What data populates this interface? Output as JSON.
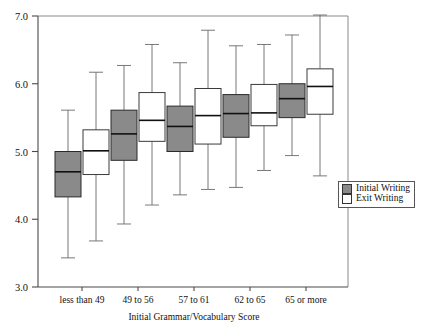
{
  "chart_data": {
    "type": "box",
    "title": "",
    "xlabel": "Initial Grammar/Vocabulary Score",
    "ylabel": "",
    "ylim": [
      3.0,
      7.0
    ],
    "ytick_labels": [
      "7.0",
      "6.0",
      "5.0",
      "4.0",
      "3.0"
    ],
    "ytick_values": [
      7.0,
      6.0,
      5.0,
      4.0,
      3.0
    ],
    "grid": false,
    "legend_position": "right",
    "categories": [
      "less than 49",
      "49 to 56",
      "57 to 61",
      "62 to 65",
      "65 or more"
    ],
    "series": [
      {
        "name": "Initial Writing",
        "color": "#8a8a8a",
        "boxes": [
          {
            "category": "less than 49",
            "min": 3.43,
            "q1": 4.33,
            "median": 4.7,
            "q3": 5.0,
            "max": 5.61
          },
          {
            "category": "49 to 56",
            "min": 3.93,
            "q1": 4.87,
            "median": 5.26,
            "q3": 5.61,
            "max": 6.27
          },
          {
            "category": "57 to 61",
            "min": 4.36,
            "q1": 5.0,
            "median": 5.37,
            "q3": 5.67,
            "max": 6.31
          },
          {
            "category": "62 to 65",
            "min": 4.47,
            "q1": 5.21,
            "median": 5.56,
            "q3": 5.84,
            "max": 6.56
          },
          {
            "category": "65 or more",
            "min": 4.94,
            "q1": 5.5,
            "median": 5.78,
            "q3": 6.0,
            "max": 6.72
          }
        ]
      },
      {
        "name": "Exit Writing",
        "color": "#ffffff",
        "boxes": [
          {
            "category": "less than 49",
            "min": 3.68,
            "q1": 4.66,
            "median": 5.01,
            "q3": 5.32,
            "max": 6.17
          },
          {
            "category": "49 to 56",
            "min": 4.21,
            "q1": 5.15,
            "median": 5.46,
            "q3": 5.87,
            "max": 6.58
          },
          {
            "category": "57 to 61",
            "min": 4.44,
            "q1": 5.11,
            "median": 5.53,
            "q3": 5.93,
            "max": 6.79
          },
          {
            "category": "62 to 65",
            "min": 4.72,
            "q1": 5.38,
            "median": 5.57,
            "q3": 5.99,
            "max": 6.58
          },
          {
            "category": "65 or more",
            "min": 4.64,
            "q1": 5.55,
            "median": 5.96,
            "q3": 6.22,
            "max": 7.02
          }
        ]
      }
    ]
  },
  "legend": {
    "items": [
      {
        "label": "Initial Writing",
        "swatch": "filled-gray-square"
      },
      {
        "label": "Exit Writing",
        "swatch": "open-white-square"
      }
    ]
  },
  "axes": {
    "x_title": "Initial Grammar/Vocabulary Score",
    "y_ticks": [
      "7.0",
      "6.0",
      "5.0",
      "4.0",
      "3.0"
    ],
    "x_ticks": [
      "less than 49",
      "49 to 56",
      "57 to 61",
      "62 to 65",
      "65 or more"
    ]
  },
  "colors": {
    "initial_fill": "#8a8a8a",
    "exit_fill": "#ffffff",
    "axis": "#4a4a4a",
    "median": "#111111"
  }
}
